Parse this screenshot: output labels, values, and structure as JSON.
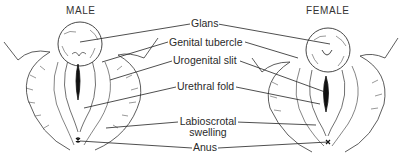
{
  "diagram": {
    "type": "anatomical-comparison",
    "panels": [
      {
        "id": "male",
        "title": "MALE"
      },
      {
        "id": "female",
        "title": "FEMALE"
      }
    ],
    "labels": [
      {
        "id": "glans",
        "text": "Glans"
      },
      {
        "id": "genital-tubercle",
        "text": "Genital tubercle"
      },
      {
        "id": "urogenital-slit",
        "text": "Urogenital slit"
      },
      {
        "id": "urethral-fold",
        "text": "Urethral fold"
      },
      {
        "id": "labioscrotal-swelling",
        "line1": "Labioscrotal",
        "line2": "swelling"
      },
      {
        "id": "anus",
        "text": "Anus"
      }
    ],
    "colors": {
      "ink": "#222222",
      "background": "#ffffff"
    }
  }
}
